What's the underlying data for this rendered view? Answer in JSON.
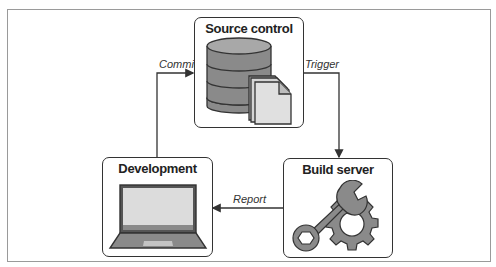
{
  "diagram": {
    "type": "cycle-flow",
    "nodes": [
      {
        "id": "source_control",
        "label": "Source control",
        "icon": "database-with-document-icon"
      },
      {
        "id": "build_server",
        "label": "Build server",
        "icon": "wrench-and-gear-icon"
      },
      {
        "id": "development",
        "label": "Development",
        "icon": "laptop-icon"
      }
    ],
    "edges": [
      {
        "from": "development",
        "to": "source_control",
        "label": "Commit"
      },
      {
        "from": "source_control",
        "to": "build_server",
        "label": "Trigger"
      },
      {
        "from": "build_server",
        "to": "development",
        "label": "Report"
      }
    ]
  },
  "colors": {
    "border": "#333333",
    "icon_fill": "#8a8a8a",
    "icon_light": "#d9d9d9",
    "frame": "#9a9a9a"
  }
}
